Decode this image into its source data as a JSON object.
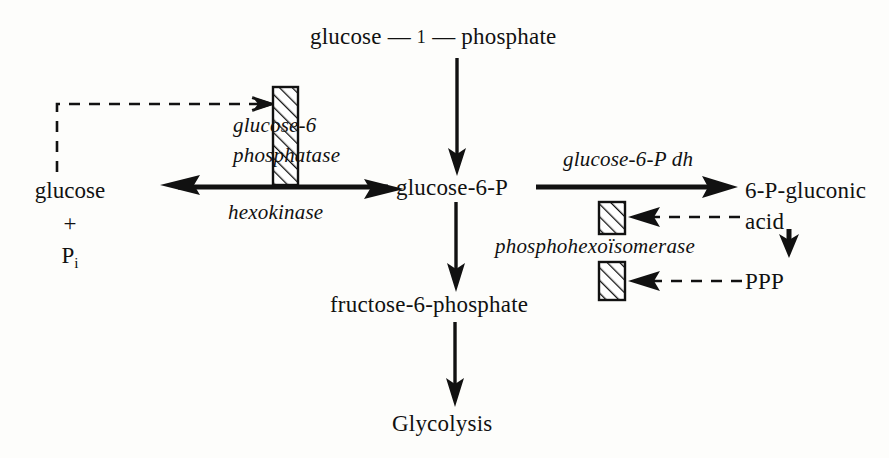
{
  "figure": {
    "type": "metabolic-pathway-diagram",
    "background_color": "#fdfdfb",
    "ink_color": "#111111"
  },
  "nodes": {
    "glucose_1_phosphate": {
      "label_left": "glucose",
      "dash_1": "—",
      "numeral": "1",
      "dash_2": "—",
      "label_right": "phosphate",
      "full": "glucose — 1 — phosphate"
    },
    "glucose": "glucose",
    "plus": "+",
    "pi_symbol": "P",
    "pi_subscript": "i",
    "glucose_6_p": "glucose-6-P",
    "fructose_6_phosphate": "fructose-6-phosphate",
    "glycolysis": "Glycolysis",
    "gluconic_acid_line1": "6-P-gluconic",
    "gluconic_acid_line2": "acid",
    "ppp": "PPP"
  },
  "enzymes": {
    "glucose_6_phosphatase_line1": "glucose-6",
    "glucose_6_phosphatase_line2": "phosphatase",
    "hexokinase": "hexokinase",
    "glucose_6_p_dh": "glucose-6-P dh",
    "phosphohexoisomerase": "phosphohexoïsomerase"
  },
  "edges": [
    {
      "name": "g1p-to-g6p",
      "style": "solid",
      "heads": "down",
      "from": "glucose — 1 — phosphate",
      "to": "glucose-6-P"
    },
    {
      "name": "glucose-g6p-reversible",
      "style": "solid",
      "heads": "both",
      "from": "glucose + Pi",
      "to": "glucose-6-P",
      "enzyme_above": "glucose-6 phosphatase",
      "enzyme_below": "hexokinase"
    },
    {
      "name": "g6p-to-gluconic-acid",
      "style": "solid",
      "heads": "right",
      "from": "glucose-6-P",
      "to": "6-P-gluconic acid",
      "enzyme_above": "glucose-6-P dh"
    },
    {
      "name": "g6p-to-f6p",
      "style": "solid",
      "heads": "down",
      "from": "glucose-6-P",
      "to": "fructose-6-phosphate",
      "enzyme": "phosphohexoïsomerase"
    },
    {
      "name": "f6p-to-glycolysis",
      "style": "solid",
      "heads": "down",
      "from": "fructose-6-phosphate",
      "to": "Glycolysis"
    },
    {
      "name": "gluconic-acid-to-ppp",
      "style": "solid",
      "heads": "down",
      "from": "6-P-gluconic acid",
      "to": "PPP"
    },
    {
      "name": "glucose-feedback-to-phosphatase",
      "style": "dashed",
      "heads": "right",
      "from": "glucose + Pi",
      "to": "glucose-6 phosphatase regulation bar"
    },
    {
      "name": "gluconic-acid-feedback",
      "style": "dashed",
      "heads": "left",
      "from": "6-P-gluconic acid",
      "to": "phosphohexoïsomerase regulation bar (upper)"
    },
    {
      "name": "ppp-feedback",
      "style": "dashed",
      "heads": "left",
      "from": "PPP",
      "to": "phosphohexoïsomerase regulation bar (lower)"
    }
  ],
  "regulation_bars": [
    {
      "name": "phosphatase-bar",
      "hatched": true
    },
    {
      "name": "phosphohexoisomerase-bar-upper",
      "hatched": true
    },
    {
      "name": "phosphohexoisomerase-bar-lower",
      "hatched": true
    }
  ]
}
